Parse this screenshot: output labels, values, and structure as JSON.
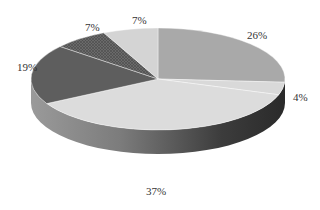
{
  "chart_data": {
    "type": "pie",
    "variant": "3d",
    "title": "",
    "start_angle_deg": 90,
    "direction": "clockwise",
    "slices": [
      {
        "label": "26%",
        "value": 26,
        "color": "#a9a9a9"
      },
      {
        "label": "4%",
        "value": 4,
        "color": "#d9d9d9"
      },
      {
        "label": "37%",
        "value": 37,
        "color": "#dcdcdc"
      },
      {
        "label": "19%",
        "value": 19,
        "color": "#5e5e5e"
      },
      {
        "label": "7%",
        "value": 7,
        "color": "#6a6a6a",
        "pattern": "crosshatch"
      },
      {
        "label": "7%",
        "value": 7,
        "color": "#d4d4d4"
      }
    ],
    "legend": null
  },
  "labels": {
    "s0": "26%",
    "s1": "4%",
    "s2": "37%",
    "s3": "19%",
    "s4": "7%",
    "s5": "7%"
  }
}
